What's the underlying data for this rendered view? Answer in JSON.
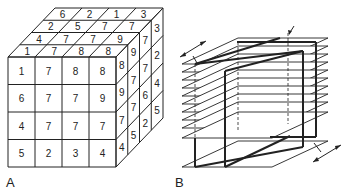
{
  "panels": [
    {
      "label": "A",
      "description": "4x4x4 cube of numbered voxels",
      "front_face": [
        [
          "1",
          "7",
          "8",
          "8"
        ],
        [
          "6",
          "7",
          "7",
          "9"
        ],
        [
          "4",
          "7",
          "7",
          "7"
        ],
        [
          "5",
          "2",
          "3",
          "4"
        ]
      ],
      "top_face_back_to_front": [
        [
          "6",
          "2",
          "1",
          "3"
        ],
        [
          "2",
          "5",
          "7",
          "7"
        ],
        [
          "4",
          "7",
          "7",
          "9"
        ],
        [
          "1",
          "7",
          "8",
          "8"
        ]
      ],
      "side_face_front_to_back": [
        [
          "8",
          "9",
          "7",
          "4"
        ],
        [
          "9",
          "7",
          "7",
          "5"
        ],
        [
          "7",
          "7",
          "6",
          "2"
        ],
        [
          "3",
          "2",
          "4",
          "5"
        ]
      ]
    },
    {
      "label": "B",
      "description": "Stack of parallel slice planes with oblique reformatted plane",
      "plane_count": 11
    }
  ],
  "colors": {
    "line": "#222222",
    "background": "#ffffff"
  }
}
